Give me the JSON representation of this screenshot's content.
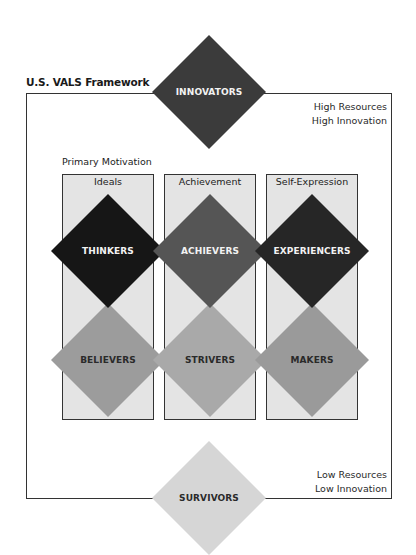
{
  "title": "U.S. VALS Framework",
  "high_note": [
    "High Resources",
    "High Innovation"
  ],
  "low_note": [
    "Low Resources",
    "Low Innovation"
  ],
  "primary_motivation_label": "Primary Motivation",
  "columns": [
    {
      "label": "Ideals"
    },
    {
      "label": "Achievement"
    },
    {
      "label": "Self-Expression"
    }
  ],
  "segments": {
    "innovators": {
      "label": "INNOVATORS",
      "color": "#3b3b3b"
    },
    "thinkers": {
      "label": "THINKERS",
      "color": "#161616"
    },
    "achievers": {
      "label": "ACHIEVERS",
      "color": "#555555"
    },
    "experiencers": {
      "label": "EXPERIENCERS",
      "color": "#262626"
    },
    "believers": {
      "label": "BELIEVERS",
      "color": "#9c9c9c"
    },
    "strivers": {
      "label": "STRIVERS",
      "color": "#a9a9a9"
    },
    "makers": {
      "label": "MAKERS",
      "color": "#9a9a9a"
    },
    "survivors": {
      "label": "SURVIVORS",
      "color": "#d6d6d6"
    }
  }
}
